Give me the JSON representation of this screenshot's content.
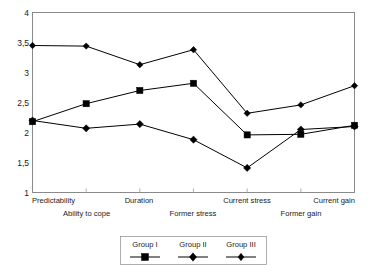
{
  "chart_data": {
    "type": "line",
    "title": "",
    "xlabel": "",
    "ylabel": "",
    "categories": [
      "Predictability",
      "Ability to cope",
      "Duration",
      "Former stress",
      "Current stress",
      "Former gain",
      "Current gain"
    ],
    "ylim": [
      1,
      4
    ],
    "ytick_labels": [
      "1",
      "1,5",
      "2",
      "2,5",
      "3",
      "3,5",
      "4"
    ],
    "ytick_values": [
      1,
      1.5,
      2,
      2.5,
      3,
      3.5,
      4
    ],
    "grid": false,
    "legend_position": "bottom",
    "series": [
      {
        "name": "Group I",
        "marker": "square",
        "values": [
          2.18,
          2.48,
          2.7,
          2.82,
          1.96,
          1.97,
          2.12
        ]
      },
      {
        "name": "Group II",
        "marker": "diamond",
        "values": [
          2.2,
          2.07,
          2.14,
          1.88,
          1.41,
          2.05,
          2.1
        ]
      },
      {
        "name": "Group III",
        "marker": "diamond",
        "values": [
          3.45,
          3.44,
          3.13,
          3.38,
          2.32,
          2.46,
          2.78
        ]
      }
    ]
  },
  "axis": {
    "y_labels": [
      "4",
      "3,5",
      "3",
      "2,5",
      "2",
      "1,5",
      "1"
    ]
  },
  "legend": {
    "entries": [
      "Group I",
      "Group II",
      "Group III"
    ]
  },
  "colors": {
    "series_stroke": "#000000",
    "frame": "#8a8a8a",
    "text": "#1a1a1a",
    "background": "#ffffff"
  }
}
